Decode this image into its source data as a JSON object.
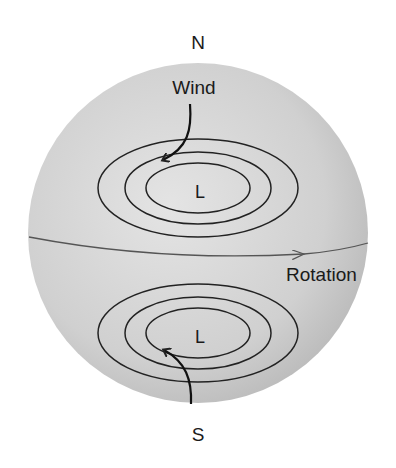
{
  "diagram": {
    "labels": {
      "north": "N",
      "south": "S",
      "wind": "Wind",
      "rotation": "Rotation",
      "low_north": "L",
      "low_south": "L"
    },
    "colors": {
      "background": "#ffffff",
      "sphere_light": "#dedede",
      "sphere_dark": "#b9b9b9",
      "line": "#222222",
      "equator": "#555555"
    }
  }
}
